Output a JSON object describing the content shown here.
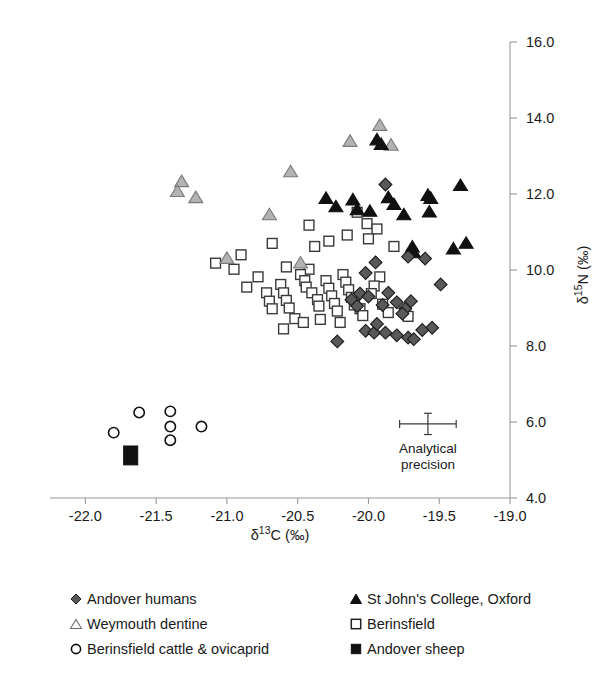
{
  "chart_data": {
    "type": "scatter",
    "title": "",
    "xlabel": "δ¹³C (‰)",
    "ylabel": "δ¹⁵N (‰)",
    "xlim": [
      -22.25,
      -19.0
    ],
    "ylim": [
      4.0,
      16.0
    ],
    "xticks": [
      -22.0,
      -21.5,
      -21.0,
      -20.5,
      -20.0,
      -19.5,
      -19.0
    ],
    "xtick_labels": [
      "-22.0",
      "-21.5",
      "-21.0",
      "-20.5",
      "-20.0",
      "-19.5",
      "-19.0"
    ],
    "yticks": [
      4.0,
      6.0,
      8.0,
      10.0,
      12.0,
      14.0,
      16.0
    ],
    "ytick_labels": [
      "4.0",
      "6.0",
      "8.0",
      "10.0",
      "12.0",
      "14.0",
      "16.0"
    ],
    "grid": false,
    "legend_position": "below-plot",
    "axis_spines": [
      "bottom",
      "right"
    ],
    "annotation": {
      "label_line1": "Analytical",
      "label_line2": "precision",
      "center_x": -19.58,
      "center_y": 5.95,
      "x_halfwidth": 0.2,
      "y_halfheight": 0.28
    },
    "series": [
      {
        "name": "Andover humans",
        "marker": "diamond",
        "fill": "#595959",
        "edge": "#1a1a1a",
        "points": [
          [
            -19.88,
            12.25
          ],
          [
            -19.72,
            10.35
          ],
          [
            -19.6,
            10.3
          ],
          [
            -19.49,
            9.62
          ],
          [
            -19.95,
            10.2
          ],
          [
            -20.02,
            9.92
          ],
          [
            -20.06,
            9.38
          ],
          [
            -20.12,
            9.22
          ],
          [
            -19.9,
            9.08
          ],
          [
            -19.8,
            9.15
          ],
          [
            -19.74,
            8.98
          ],
          [
            -19.55,
            8.48
          ],
          [
            -20.02,
            8.4
          ],
          [
            -19.96,
            8.35
          ],
          [
            -19.88,
            8.35
          ],
          [
            -19.8,
            8.28
          ],
          [
            -19.72,
            8.22
          ],
          [
            -19.68,
            8.18
          ],
          [
            -19.62,
            8.42
          ],
          [
            -20.22,
            8.12
          ],
          [
            -20.08,
            9.05
          ],
          [
            -19.86,
            9.4
          ],
          [
            -20.0,
            9.3
          ],
          [
            -19.76,
            8.85
          ],
          [
            -19.7,
            9.18
          ],
          [
            -19.94,
            8.58
          ]
        ]
      },
      {
        "name": "St John's College, Oxford",
        "marker": "triangle",
        "fill": "#111111",
        "edge": "#111111",
        "points": [
          [
            -19.94,
            13.42
          ],
          [
            -19.91,
            13.3
          ],
          [
            -19.86,
            11.9
          ],
          [
            -19.82,
            11.72
          ],
          [
            -20.11,
            11.84
          ],
          [
            -20.08,
            11.58
          ],
          [
            -20.3,
            11.88
          ],
          [
            -19.99,
            11.54
          ],
          [
            -19.58,
            11.96
          ],
          [
            -19.56,
            11.88
          ],
          [
            -19.57,
            11.52
          ],
          [
            -19.35,
            12.22
          ],
          [
            -19.69,
            10.6
          ],
          [
            -19.68,
            10.45
          ],
          [
            -19.4,
            10.55
          ],
          [
            -19.31,
            10.7
          ],
          [
            -20.23,
            11.66
          ],
          [
            -19.75,
            11.45
          ]
        ]
      },
      {
        "name": "Weymouth dentine",
        "marker": "triangle",
        "fill": "#b3b3b3",
        "edge": "#7a7a7a",
        "points": [
          [
            -19.92,
            13.8
          ],
          [
            -20.13,
            13.38
          ],
          [
            -19.84,
            13.28
          ],
          [
            -20.55,
            12.58
          ],
          [
            -21.32,
            12.32
          ],
          [
            -21.35,
            12.06
          ],
          [
            -21.22,
            11.9
          ],
          [
            -20.7,
            11.45
          ],
          [
            -21.0,
            10.3
          ],
          [
            -20.48,
            10.18
          ]
        ]
      },
      {
        "name": "Berinsfield",
        "marker": "square",
        "fill": "#ffffff",
        "edge": "#3a3a3a",
        "points": [
          [
            -20.08,
            11.52
          ],
          [
            -20.01,
            11.22
          ],
          [
            -19.94,
            11.08
          ],
          [
            -20.28,
            10.76
          ],
          [
            -20.38,
            10.62
          ],
          [
            -20.9,
            10.4
          ],
          [
            -20.95,
            10.02
          ],
          [
            -21.08,
            10.18
          ],
          [
            -20.58,
            10.08
          ],
          [
            -20.42,
            10.02
          ],
          [
            -20.48,
            9.88
          ],
          [
            -20.45,
            9.72
          ],
          [
            -20.44,
            9.55
          ],
          [
            -20.4,
            9.4
          ],
          [
            -20.36,
            9.22
          ],
          [
            -20.35,
            9.05
          ],
          [
            -20.3,
            9.72
          ],
          [
            -20.28,
            9.52
          ],
          [
            -20.26,
            9.32
          ],
          [
            -20.24,
            9.12
          ],
          [
            -20.22,
            8.92
          ],
          [
            -20.62,
            9.62
          ],
          [
            -20.6,
            9.4
          ],
          [
            -20.58,
            9.2
          ],
          [
            -20.56,
            9.0
          ],
          [
            -20.72,
            9.4
          ],
          [
            -20.7,
            9.18
          ],
          [
            -20.68,
            8.98
          ],
          [
            -20.18,
            9.88
          ],
          [
            -20.16,
            9.68
          ],
          [
            -20.14,
            9.48
          ],
          [
            -20.12,
            9.28
          ],
          [
            -20.1,
            9.08
          ],
          [
            -20.06,
            8.98
          ],
          [
            -20.04,
            8.8
          ],
          [
            -20.52,
            8.72
          ],
          [
            -20.46,
            8.62
          ],
          [
            -20.34,
            8.7
          ],
          [
            -20.2,
            8.62
          ],
          [
            -19.92,
            9.82
          ],
          [
            -19.9,
            9.1
          ],
          [
            -19.86,
            8.88
          ],
          [
            -20.6,
            8.45
          ],
          [
            -20.42,
            11.18
          ],
          [
            -20.0,
            10.82
          ],
          [
            -19.82,
            10.62
          ],
          [
            -20.68,
            10.7
          ],
          [
            -20.78,
            9.82
          ],
          [
            -20.86,
            9.55
          ],
          [
            -19.96,
            9.58
          ],
          [
            -19.98,
            9.38
          ],
          [
            -19.72,
            8.78
          ],
          [
            -20.15,
            10.92
          ]
        ]
      },
      {
        "name": "Berinsfield cattle & ovicaprid",
        "marker": "circle",
        "fill": "#ffffff",
        "edge": "#111111",
        "points": [
          [
            -21.62,
            6.25
          ],
          [
            -21.8,
            5.72
          ],
          [
            -21.4,
            6.28
          ],
          [
            -21.4,
            5.88
          ],
          [
            -21.4,
            5.52
          ],
          [
            -21.18,
            5.88
          ]
        ]
      },
      {
        "name": "Andover sheep",
        "marker": "filled-square",
        "fill": "#111111",
        "edge": "#111111",
        "points": [
          [
            -21.68,
            5.12
          ]
        ]
      }
    ]
  },
  "legend": {
    "left_column": [
      {
        "label": "Andover humans",
        "glyph": "filled-diamond-grey"
      },
      {
        "label": "Weymouth dentine",
        "glyph": "open-triangle-grey"
      },
      {
        "label": "Berinsfield cattle & ovicaprid",
        "glyph": "open-circle"
      }
    ],
    "right_column": [
      {
        "label": "St John's College, Oxford",
        "glyph": "filled-triangle-black"
      },
      {
        "label": "Berinsfield",
        "glyph": "open-square"
      },
      {
        "label": "Andover sheep",
        "glyph": "filled-square-black"
      }
    ]
  },
  "colors": {
    "andover_humans": "#595959",
    "st_johns": "#111111",
    "weymouth": "#b3b3b3",
    "berinsfield": "#ffffff",
    "axis": "#9a9a9a",
    "text": "#1a1a1a"
  }
}
